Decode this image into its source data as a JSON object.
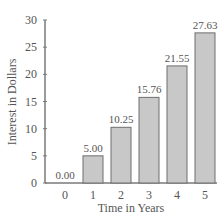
{
  "chart_data": {
    "type": "bar",
    "title": "",
    "xlabel": "Time in Years",
    "ylabel": "Interest in Dollars",
    "categories": [
      "0",
      "1",
      "2",
      "3",
      "4",
      "5"
    ],
    "values": [
      0.0,
      5.0,
      10.25,
      15.76,
      21.55,
      27.63
    ],
    "data_labels": [
      "0.00",
      "5.00",
      "10.25",
      "15.76",
      "21.55",
      "27.63"
    ],
    "ylim": [
      0,
      30
    ],
    "yticks": [
      0,
      5,
      10,
      15,
      20,
      25,
      30
    ],
    "grid": false,
    "legend": null
  },
  "colors": {
    "bar_fill": "#c8c8c8",
    "bar_stroke": "#6e6e6e",
    "axis": "#7a7a7a",
    "text": "#555555"
  }
}
